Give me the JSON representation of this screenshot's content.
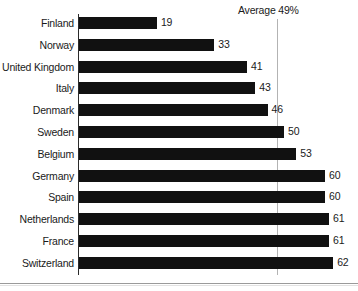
{
  "chart_data": {
    "type": "bar",
    "orientation": "horizontal",
    "title": "",
    "xlabel": "",
    "ylabel": "",
    "categories": [
      "Finland",
      "Norway",
      "United Kingdom",
      "Italy",
      "Denmark",
      "Sweden",
      "Belgium",
      "Germany",
      "Spain",
      "Netherlands",
      "France",
      "Switzerland"
    ],
    "values": [
      19,
      33,
      41,
      43,
      46,
      50,
      53,
      60,
      60,
      61,
      61,
      62
    ],
    "value_labels": [
      "19",
      "33",
      "41",
      "43",
      "46",
      "50",
      "53",
      "60",
      "60",
      "61",
      "61",
      "62"
    ],
    "xlim": [
      0,
      68
    ],
    "grid": false,
    "legend": false,
    "bar_color": "#111111",
    "annotations": [
      {
        "name": "average-line",
        "label": "Average 49%",
        "value": 49,
        "color": "#b3b3b3"
      }
    ]
  },
  "annotation": {
    "average_label": "Average 49%"
  }
}
